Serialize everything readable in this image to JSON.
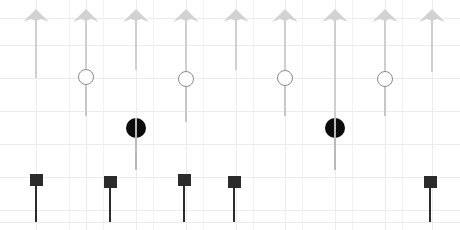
{
  "figure": {
    "title": "",
    "width": 460,
    "height": 230,
    "background": "#ffffff"
  },
  "grid": {
    "visible": true,
    "color_minor": "#f5f5f6",
    "color_major": "#ebebec",
    "x_spacing": 33,
    "y_spacing": 33,
    "x_origin": 36,
    "y_origin": 18
  },
  "style": {
    "arrow_color": "#d2d2d2",
    "arrow_stem_color": "#cfcfcf",
    "open_circle_edge": "#8b8b8b",
    "open_circle_face": "#ffffff",
    "open_circle_stem": "#c7c7c7",
    "filled_circle_color": "#0b0b0b",
    "filled_circle_stem": "#b9b9b9",
    "square_color": "#2b2b2b",
    "square_stem_color": "#2b2b2b"
  },
  "chart_data": {
    "type": "scatter",
    "title": "",
    "xlabel": "",
    "ylabel": "",
    "xlim": [
      0,
      460
    ],
    "ylim": [
      230,
      0
    ],
    "grid": true,
    "legend": "none",
    "series": [
      {
        "name": "arrow-series",
        "marker": "arrow-up",
        "color": "#d2d2d2",
        "points": [
          {
            "x": 36,
            "y": 18,
            "stem_to": 78
          },
          {
            "x": 86,
            "y": 18,
            "stem_to": 116
          },
          {
            "x": 136,
            "y": 18,
            "stem_to": 70
          },
          {
            "x": 186,
            "y": 18,
            "stem_to": 122
          },
          {
            "x": 236,
            "y": 18,
            "stem_to": 70
          },
          {
            "x": 285,
            "y": 18,
            "stem_to": 116
          },
          {
            "x": 335,
            "y": 18,
            "stem_to": 125
          },
          {
            "x": 385,
            "y": 18,
            "stem_to": 116
          },
          {
            "x": 432,
            "y": 18,
            "stem_to": 72
          }
        ]
      },
      {
        "name": "open-circle-series",
        "marker": "circle-open",
        "color": "#8b8b8b",
        "points": [
          {
            "x": 86,
            "y": 77,
            "stem_to": 116
          },
          {
            "x": 186,
            "y": 79,
            "stem_to": 122
          },
          {
            "x": 285,
            "y": 78,
            "stem_to": 116
          },
          {
            "x": 385,
            "y": 79,
            "stem_to": 116
          }
        ]
      },
      {
        "name": "filled-circle-series",
        "marker": "circle-filled",
        "color": "#0b0b0b",
        "points": [
          {
            "x": 136,
            "y": 128,
            "stem_to": 170
          },
          {
            "x": 335,
            "y": 128,
            "stem_to": 170
          }
        ]
      },
      {
        "name": "square-series",
        "marker": "square",
        "color": "#2b2b2b",
        "points": [
          {
            "x": 36,
            "y": 180,
            "stem_to": 222
          },
          {
            "x": 110,
            "y": 182,
            "stem_to": 222
          },
          {
            "x": 184,
            "y": 180,
            "stem_to": 222
          },
          {
            "x": 234,
            "y": 182,
            "stem_to": 222
          },
          {
            "x": 430,
            "y": 182,
            "stem_to": 222
          }
        ]
      }
    ],
    "gridlines": {
      "vertical_x": [
        36,
        69,
        86,
        103,
        136,
        153,
        186,
        203,
        236,
        253,
        285,
        302,
        335,
        352,
        385,
        402,
        432
      ],
      "horizontal_y": [
        18,
        45,
        78,
        111,
        144,
        177,
        210,
        222
      ]
    }
  }
}
